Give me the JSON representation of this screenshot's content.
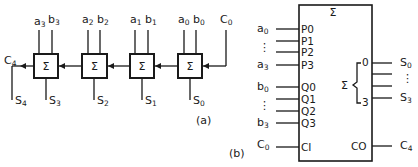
{
  "diagram": {
    "part_a": {
      "caption": "(a)",
      "adder_symbol": "Σ",
      "stages": [
        {
          "a": "a",
          "a_sub": "3",
          "b": "b",
          "b_sub": "3",
          "s": "S",
          "s_sub": "3"
        },
        {
          "a": "a",
          "a_sub": "2",
          "b": "b",
          "b_sub": "2",
          "s": "S",
          "s_sub": "2"
        },
        {
          "a": "a",
          "a_sub": "1",
          "b": "b",
          "b_sub": "1",
          "s": "S",
          "s_sub": "1"
        },
        {
          "a": "a",
          "a_sub": "0",
          "b": "b",
          "b_sub": "0",
          "s": "S",
          "s_sub": "0"
        }
      ],
      "carry_in": {
        "label": "C",
        "sub": "0"
      },
      "carry_out": {
        "label": "C",
        "sub": "4"
      },
      "carry_sum": {
        "label": "S",
        "sub": "4"
      }
    },
    "part_b": {
      "caption": "(b)",
      "block_symbol": "Σ",
      "inputs_p": [
        {
          "pin": "P0",
          "signal": "a",
          "sub": "0"
        },
        {
          "pin": "P1",
          "signal": "",
          "sub": ""
        },
        {
          "pin": "P2",
          "signal": "",
          "sub": ""
        },
        {
          "pin": "P3",
          "signal": "a",
          "sub": "3"
        }
      ],
      "inputs_q": [
        {
          "pin": "Q0",
          "signal": "b",
          "sub": "0"
        },
        {
          "pin": "Q1",
          "signal": "",
          "sub": ""
        },
        {
          "pin": "Q2",
          "signal": "",
          "sub": ""
        },
        {
          "pin": "Q3",
          "signal": "b",
          "sub": "3"
        }
      ],
      "ellipsis": "⋮",
      "carry_in": {
        "pin": "CI",
        "signal": "C",
        "sub": "0"
      },
      "carry_out": {
        "pin": "CO",
        "signal": "C",
        "sub": "4"
      },
      "sum_group": {
        "symbol": "Σ",
        "first": "0",
        "last": "3"
      },
      "outputs": [
        {
          "signal": "S",
          "sub": "0"
        },
        {
          "signal": "S",
          "sub": "3"
        }
      ]
    }
  }
}
